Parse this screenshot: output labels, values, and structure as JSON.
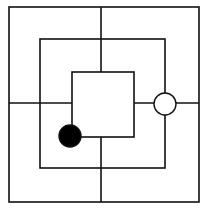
{
  "game": {
    "name": "Nine Men's Morris",
    "board": {
      "stroke_color": "#111111",
      "background": "#ffffff",
      "squares": [
        {
          "id": "outer",
          "x1": 9,
          "y1": 7,
          "x2": 199,
          "y2": 202
        },
        {
          "id": "middle",
          "x1": 40,
          "y1": 39,
          "x2": 165,
          "y2": 168
        },
        {
          "id": "inner",
          "x1": 72,
          "y1": 72,
          "x2": 134,
          "y2": 137
        }
      ],
      "connectors": [
        {
          "id": "top",
          "x1": 101,
          "y1": 7,
          "x2": 101,
          "y2": 72
        },
        {
          "id": "bottom",
          "x1": 101,
          "y1": 137,
          "x2": 101,
          "y2": 202
        },
        {
          "id": "left",
          "x1": 9,
          "y1": 103,
          "x2": 72,
          "y2": 103
        },
        {
          "id": "right",
          "x1": 134,
          "y1": 103,
          "x2": 199,
          "y2": 103
        }
      ]
    },
    "pieces": [
      {
        "color": "white",
        "fill": "#ffffff",
        "cx": 165,
        "cy": 104,
        "r": 11,
        "position": "middle-square-right"
      },
      {
        "color": "black",
        "fill": "#000000",
        "cx": 70,
        "cy": 136,
        "r": 11,
        "position": "inner-square-bottom-left"
      }
    ]
  }
}
